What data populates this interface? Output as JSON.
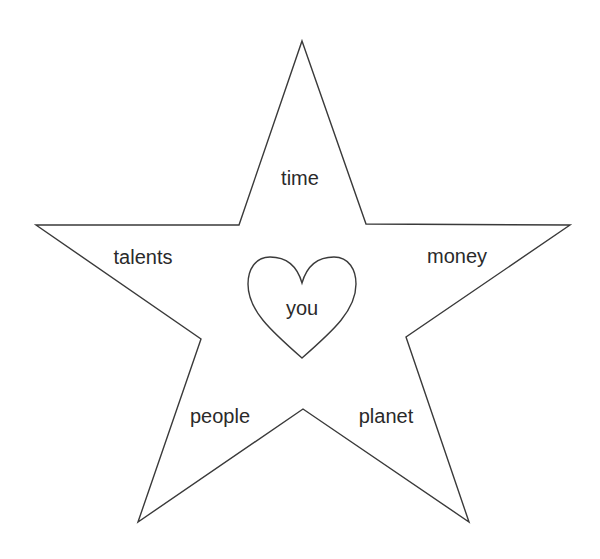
{
  "diagram": {
    "shape": "star",
    "center_shape": "heart",
    "stroke_color": "#3a3a3a",
    "background": "#ffffff",
    "center_label": "you",
    "point_labels": {
      "top": "time",
      "left": "talents",
      "right": "money",
      "bottom_left": "people",
      "bottom_right": "planet"
    }
  }
}
